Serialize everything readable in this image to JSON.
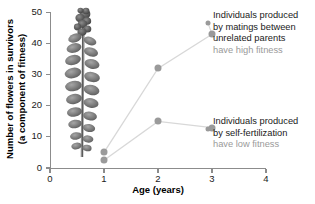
{
  "chart_data": {
    "type": "scatter",
    "title": "",
    "xlabel": "Age (years)",
    "ylabel_line1": "Number of flowers in survivors",
    "ylabel_line2": "(a component of fitness)",
    "xlim": [
      0,
      4
    ],
    "ylim": [
      0,
      50
    ],
    "xticks": [
      "0",
      "1",
      "2",
      "3",
      "4"
    ],
    "yticks": [
      "0",
      "10",
      "20",
      "30",
      "40",
      "50"
    ],
    "xtick_values": [
      0,
      1,
      2,
      3,
      4
    ],
    "ytick_values": [
      0,
      10,
      20,
      30,
      40,
      50
    ],
    "grid": false,
    "legend_position": "inline-annotation",
    "series": [
      {
        "name": "Individuals produced by matings between unrelated parents",
        "fitness": "have high fitness",
        "x": [
          1,
          2,
          3
        ],
        "values": [
          5,
          32,
          43
        ]
      },
      {
        "name": "Individuals produced by self-fertilization",
        "fitness": "have low fitness",
        "x": [
          1,
          2,
          3
        ],
        "values": [
          2.5,
          15,
          13
        ]
      }
    ],
    "annotations": [
      {
        "line1": "Individuals produced",
        "line2": "by matings between",
        "line3": "unrelated parents",
        "line4": "have high fitness"
      },
      {
        "line1": "Individuals produced",
        "line2": "by self-fertilization",
        "line3": "have low fitness"
      }
    ],
    "image_overlay": "plant-photograph",
    "colors": {
      "marker": "#9a9a9a",
      "line": "#d8d8d8",
      "axis": "#8c8c8c",
      "text": "#1a1a1a",
      "text_dim": "#9a9a9a"
    }
  }
}
